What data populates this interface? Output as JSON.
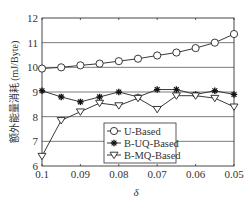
{
  "chart_data": {
    "type": "line",
    "title": "",
    "xlabel": "δ",
    "ylabel": "额外能量消耗 (mJ/Byte)",
    "x": [
      0.1,
      0.095,
      0.09,
      0.085,
      0.08,
      0.075,
      0.07,
      0.065,
      0.06,
      0.055,
      0.05
    ],
    "xticks": [
      "0.1",
      "0.09",
      "0.08",
      "0.07",
      "0.06",
      "0.05"
    ],
    "xlim": [
      0.1,
      0.05
    ],
    "ylim": [
      6,
      12
    ],
    "yticks": [
      "6",
      "7",
      "8",
      "9",
      "10",
      "11",
      "12"
    ],
    "grid": "horizontal",
    "legend_position": "lower right",
    "series": [
      {
        "name": "U-Based",
        "marker": "circle",
        "values": [
          9.95,
          10.0,
          10.08,
          10.15,
          10.25,
          10.35,
          10.48,
          10.6,
          10.78,
          11.0,
          11.35
        ]
      },
      {
        "name": "B-UQ-Based",
        "marker": "star",
        "values": [
          9.05,
          8.8,
          8.6,
          8.8,
          9.0,
          8.8,
          9.1,
          9.1,
          8.9,
          9.05,
          8.9
        ]
      },
      {
        "name": "B-MQ-Based",
        "marker": "triangle-down",
        "values": [
          6.4,
          7.85,
          8.2,
          8.55,
          8.45,
          8.75,
          8.3,
          8.85,
          8.85,
          8.75,
          8.4
        ]
      }
    ]
  }
}
